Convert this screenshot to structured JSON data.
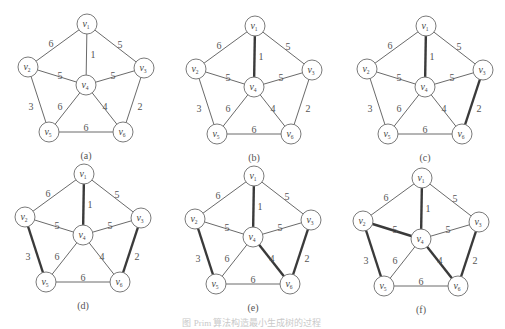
{
  "figure": {
    "caption": "图 Prim 算法构造最小生成树的过程",
    "vertices": [
      {
        "id": "v1",
        "base": "v",
        "sub": "1",
        "x": 0,
        "y": 0
      },
      {
        "id": "v2",
        "base": "v",
        "sub": "2",
        "x": -59,
        "y": 43
      },
      {
        "id": "v3",
        "base": "v",
        "sub": "3",
        "x": 57,
        "y": 44
      },
      {
        "id": "v4",
        "base": "v",
        "sub": "4",
        "x": -1,
        "y": 61
      },
      {
        "id": "v5",
        "base": "v",
        "sub": "5",
        "x": -38,
        "y": 108
      },
      {
        "id": "v6",
        "base": "v",
        "sub": "6",
        "x": 36,
        "y": 108
      }
    ],
    "edges": [
      {
        "from": "v1",
        "to": "v2",
        "weight": "6",
        "lx": -36,
        "ly": 19
      },
      {
        "from": "v1",
        "to": "v3",
        "weight": "5",
        "lx": 33,
        "ly": 20
      },
      {
        "from": "v1",
        "to": "v4",
        "weight": "1",
        "lx": 6,
        "ly": 30
      },
      {
        "from": "v2",
        "to": "v4",
        "weight": "5",
        "lx": -27,
        "ly": 51
      },
      {
        "from": "v3",
        "to": "v4",
        "weight": "5",
        "lx": 26,
        "ly": 51
      },
      {
        "from": "v2",
        "to": "v5",
        "weight": "3",
        "lx": -56,
        "ly": 82
      },
      {
        "from": "v4",
        "to": "v5",
        "weight": "6",
        "lx": -27,
        "ly": 82
      },
      {
        "from": "v4",
        "to": "v6",
        "weight": "4",
        "lx": 18,
        "ly": 82
      },
      {
        "from": "v3",
        "to": "v6",
        "weight": "2",
        "lx": 53,
        "ly": 82
      },
      {
        "from": "v5",
        "to": "v6",
        "weight": "6",
        "lx": -1,
        "ly": 103
      }
    ],
    "panels": [
      {
        "label": "(a)",
        "ox": 87,
        "oy": 24,
        "bold_edges": []
      },
      {
        "label": "(b)",
        "ox": 255,
        "oy": 26,
        "bold_edges": [
          "v1-v4"
        ]
      },
      {
        "label": "(c)",
        "ox": 426,
        "oy": 26,
        "bold_edges": [
          "v1-v4",
          "v3-v6"
        ]
      },
      {
        "label": "(d)",
        "ox": 84,
        "oy": 174,
        "bold_edges": [
          "v1-v4",
          "v3-v6",
          "v2-v5"
        ]
      },
      {
        "label": "(e)",
        "ox": 254,
        "oy": 176,
        "bold_edges": [
          "v1-v4",
          "v3-v6",
          "v2-v5",
          "v4-v6"
        ]
      },
      {
        "label": "(f)",
        "ox": 422,
        "oy": 178,
        "bold_edges": [
          "v1-v4",
          "v3-v6",
          "v2-v5",
          "v4-v6",
          "v2-v4"
        ]
      }
    ]
  }
}
